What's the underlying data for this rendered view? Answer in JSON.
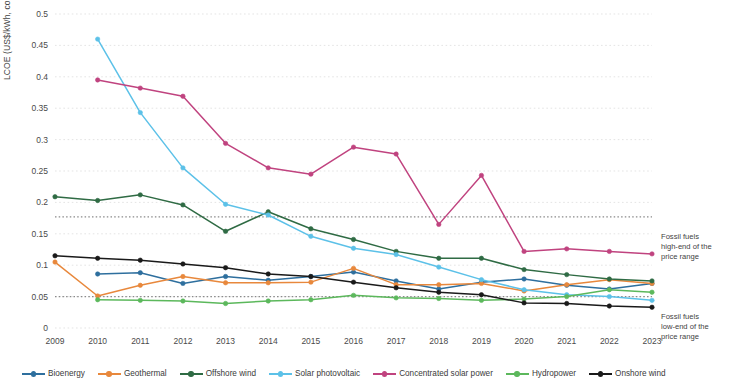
{
  "chart_data": {
    "type": "line",
    "title": "",
    "xlabel": "",
    "ylabel": "LCOE (US$/kWh, constant 2023 prices)",
    "x": [
      2009,
      2010,
      2011,
      2012,
      2013,
      2014,
      2015,
      2016,
      2017,
      2018,
      2019,
      2020,
      2021,
      2022,
      2023
    ],
    "categories": [
      "2009",
      "2010",
      "2011",
      "2012",
      "2013",
      "2014",
      "2015",
      "2016",
      "2017",
      "2018",
      "2019",
      "2020",
      "2021",
      "2022",
      "2023"
    ],
    "ylim": [
      0,
      0.5
    ],
    "yticks": [
      0,
      0.05,
      0.1,
      0.15,
      0.2,
      0.25,
      0.3,
      0.35,
      0.4,
      0.45,
      0.5
    ],
    "ytick_labels": [
      "0",
      "0.05",
      "0.1",
      "0.15",
      "0.2",
      "0.25",
      "0.3",
      "0.35",
      "0.4",
      "0.45",
      "0.5"
    ],
    "grid": true,
    "legend_position": "bottom",
    "series": [
      {
        "name": "Bioenergy",
        "color": "#2e6f9e",
        "values": [
          null,
          0.086,
          0.088,
          0.071,
          0.082,
          0.076,
          0.082,
          0.089,
          0.075,
          0.062,
          0.073,
          0.078,
          0.068,
          0.062,
          0.071
        ]
      },
      {
        "name": "Geothermal",
        "color": "#e8883c",
        "values": [
          0.105,
          0.051,
          0.068,
          0.082,
          0.072,
          0.072,
          0.073,
          0.095,
          0.069,
          0.069,
          0.071,
          0.059,
          0.069,
          0.077,
          0.071
        ]
      },
      {
        "name": "Offshore wind",
        "color": "#2f6b44",
        "values": [
          0.209,
          0.203,
          0.212,
          0.196,
          0.154,
          0.185,
          0.158,
          0.141,
          0.122,
          0.111,
          0.111,
          0.093,
          0.085,
          0.078,
          0.075
        ]
      },
      {
        "name": "Solar photovoltaic",
        "color": "#5cc1e8",
        "values": [
          null,
          0.46,
          0.343,
          0.255,
          0.197,
          0.18,
          0.146,
          0.127,
          0.117,
          0.097,
          0.077,
          0.061,
          0.053,
          0.05,
          0.044
        ]
      },
      {
        "name": "Concentrated solar power",
        "color": "#c0437f",
        "values": [
          null,
          0.395,
          0.382,
          0.369,
          0.294,
          0.255,
          0.245,
          0.288,
          0.277,
          0.165,
          0.243,
          0.122,
          0.126,
          0.122,
          0.118
        ]
      },
      {
        "name": "Hydropower",
        "color": "#5cb85c",
        "values": [
          null,
          0.045,
          0.044,
          0.043,
          0.039,
          0.043,
          0.045,
          0.052,
          0.048,
          0.047,
          0.044,
          0.046,
          0.05,
          0.061,
          0.057
        ]
      },
      {
        "name": "Onshore wind",
        "color": "#1a1a1a",
        "values": [
          0.115,
          0.111,
          0.108,
          0.102,
          0.096,
          0.086,
          0.082,
          0.073,
          0.064,
          0.057,
          0.053,
          0.04,
          0.039,
          0.035,
          0.033
        ]
      }
    ],
    "reference_lines": [
      {
        "id": "fossil-high",
        "value": 0.177,
        "label": "Fossil fuels high-end of the price range",
        "label_lines": [
          "Fossil fuels",
          "high-end of the",
          "price range"
        ],
        "style": "dotted",
        "color": "#8a8a8a"
      },
      {
        "id": "fossil-low",
        "value": 0.05,
        "label": "Fossil fuels low-end of the price range",
        "label_lines": [
          "Fossil fuels",
          "low-end of the",
          "price range"
        ],
        "style": "dotted",
        "color": "#8a8a8a"
      }
    ]
  }
}
